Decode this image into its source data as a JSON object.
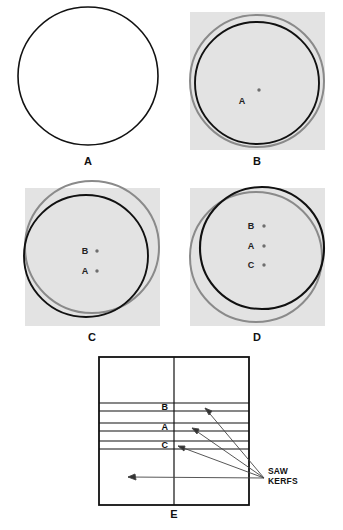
{
  "figure": {
    "background_color": "#ffffff",
    "panel_bg_color": "#e3e3e3",
    "ink_color": "#111111",
    "gray_outline_color": "#8a8a8a",
    "dot_color": "#6e6e6e"
  },
  "panels": [
    {
      "id": "A",
      "caption": "A",
      "description": "Full round circle outline, no background tint",
      "has_tint": false,
      "circles": [
        {
          "role": "current-black",
          "color": "#111111",
          "cx": 88,
          "cy": 76,
          "rx": 70,
          "ry": 69
        }
      ],
      "dots": []
    },
    {
      "id": "B",
      "caption": "B",
      "description": "Tinted square with gray original outline and shrunken black outline, one center dot A",
      "has_tint": true,
      "circles": [
        {
          "role": "original-gray",
          "color": "#8a8a8a",
          "cx": 257,
          "cy": 81,
          "rx": 67,
          "ry": 66
        },
        {
          "role": "current-black",
          "color": "#111111",
          "cx": 257,
          "cy": 83,
          "rx": 62,
          "ry": 61
        }
      ],
      "dots": [
        {
          "label": "A",
          "cx": 259,
          "cy": 90
        }
      ]
    },
    {
      "id": "C",
      "caption": "C",
      "description": "Gray original circle offset up-right, black shrunken circle offset down-left, dots B and A",
      "has_tint": true,
      "circles": [
        {
          "role": "original-gray",
          "color": "#8a8a8a",
          "cx": 92,
          "cy": 247,
          "rx": 67,
          "ry": 66
        },
        {
          "role": "current-black",
          "color": "#111111",
          "cx": 86,
          "cy": 256,
          "rx": 62,
          "ry": 61
        }
      ],
      "dots": [
        {
          "label": "B",
          "cx": 97,
          "cy": 251
        },
        {
          "label": "A",
          "cx": 97,
          "cy": 271
        }
      ]
    },
    {
      "id": "D",
      "caption": "D",
      "description": "Black circle offset up-right over gray circle offset down-left, dots B, A and C",
      "has_tint": true,
      "circles": [
        {
          "role": "original-gray",
          "color": "#8a8a8a",
          "cx": 256,
          "cy": 257,
          "rx": 66,
          "ry": 65
        },
        {
          "role": "current-black",
          "color": "#111111",
          "cx": 262,
          "cy": 248,
          "rx": 62,
          "ry": 61
        }
      ],
      "dots": [
        {
          "label": "B",
          "cx": 264,
          "cy": 226
        },
        {
          "label": "A",
          "cx": 264,
          "cy": 246
        },
        {
          "label": "C",
          "cx": 264,
          "cy": 265
        }
      ]
    },
    {
      "id": "E",
      "caption": "E",
      "description": "Squared timber cross-section with center line and three saw kerf bands labeled B, A and C",
      "has_tint": false,
      "rect": {
        "x": 99,
        "y": 357,
        "width": 150,
        "height": 148
      },
      "center_line_x": 174,
      "kerfs": [
        {
          "label": "B",
          "y_top": 403,
          "y_bottom": 411
        },
        {
          "label": "A",
          "y_top": 423,
          "y_bottom": 431
        },
        {
          "label": "C",
          "y_top": 441,
          "y_bottom": 449
        }
      ],
      "annotation": {
        "text": "SAW\nKERFS",
        "line1": "SAW",
        "line2": "KERFS",
        "x": 268,
        "y": 472,
        "arrow_origin": {
          "x": 264,
          "y": 478
        },
        "arrow_targets": [
          {
            "x": 203,
            "y": 407
          },
          {
            "x": 190,
            "y": 427
          },
          {
            "x": 176,
            "y": 445
          },
          {
            "x": 128,
            "y": 478
          }
        ]
      }
    }
  ]
}
